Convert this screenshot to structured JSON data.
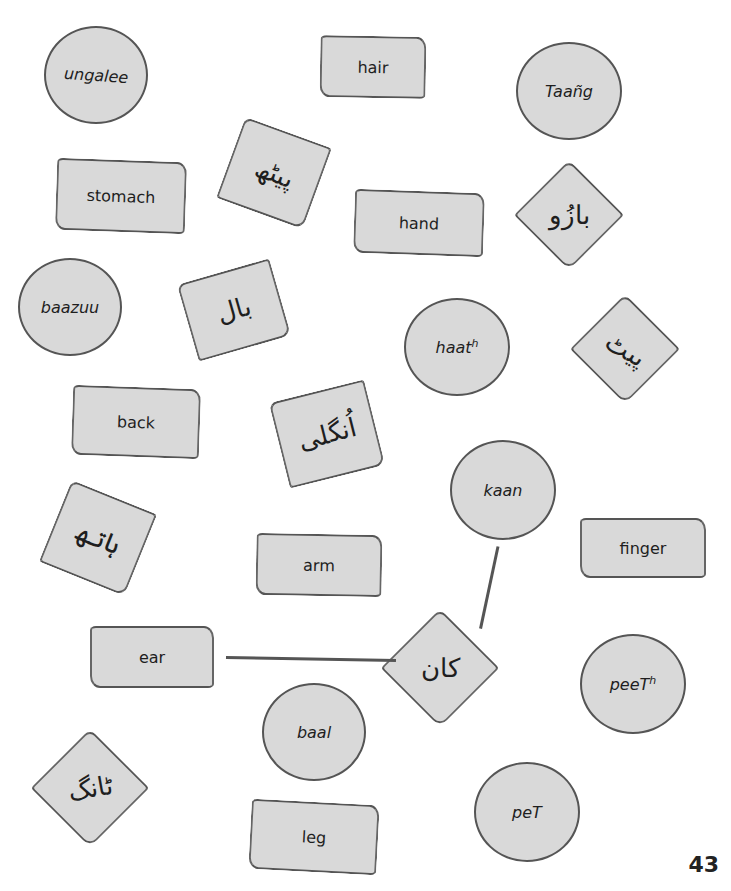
{
  "page_number": "43",
  "english_cards": [
    {
      "id": "hair",
      "label": "hair"
    },
    {
      "id": "stomach",
      "label": "stomach"
    },
    {
      "id": "hand",
      "label": "hand"
    },
    {
      "id": "back",
      "label": "back"
    },
    {
      "id": "arm",
      "label": "arm"
    },
    {
      "id": "finger",
      "label": "finger"
    },
    {
      "id": "ear",
      "label": "ear"
    },
    {
      "id": "leg",
      "label": "leg"
    }
  ],
  "transliteration_circles": [
    {
      "id": "ungalee",
      "label": "ungalee"
    },
    {
      "id": "taang",
      "label": "Taañg"
    },
    {
      "id": "baazuu",
      "label": "baazuu"
    },
    {
      "id": "haath",
      "label": "haat",
      "sup": "h"
    },
    {
      "id": "kaan",
      "label": "kaan"
    },
    {
      "id": "peeth",
      "label": "peeT",
      "sup": "h"
    },
    {
      "id": "baal",
      "label": "baal"
    },
    {
      "id": "pet",
      "label": "peT"
    }
  ],
  "urdu_cards": [
    {
      "id": "peeth-urdu",
      "label": "پیٹھ"
    },
    {
      "id": "baazuu-urdu",
      "label": "بازُو"
    },
    {
      "id": "baal-urdu",
      "label": "بال"
    },
    {
      "id": "pet-urdu",
      "label": "پیٹ"
    },
    {
      "id": "ungalee-urdu",
      "label": "اُنگلی"
    },
    {
      "id": "haath-urdu",
      "label": "ہاتھ"
    },
    {
      "id": "kaan-urdu",
      "label": "کان"
    },
    {
      "id": "taang-urdu",
      "label": "ٹانگ"
    }
  ],
  "connections": [
    {
      "from": "ear",
      "to": "kaan-urdu"
    },
    {
      "from": "kaan-urdu",
      "to": "kaan"
    }
  ]
}
